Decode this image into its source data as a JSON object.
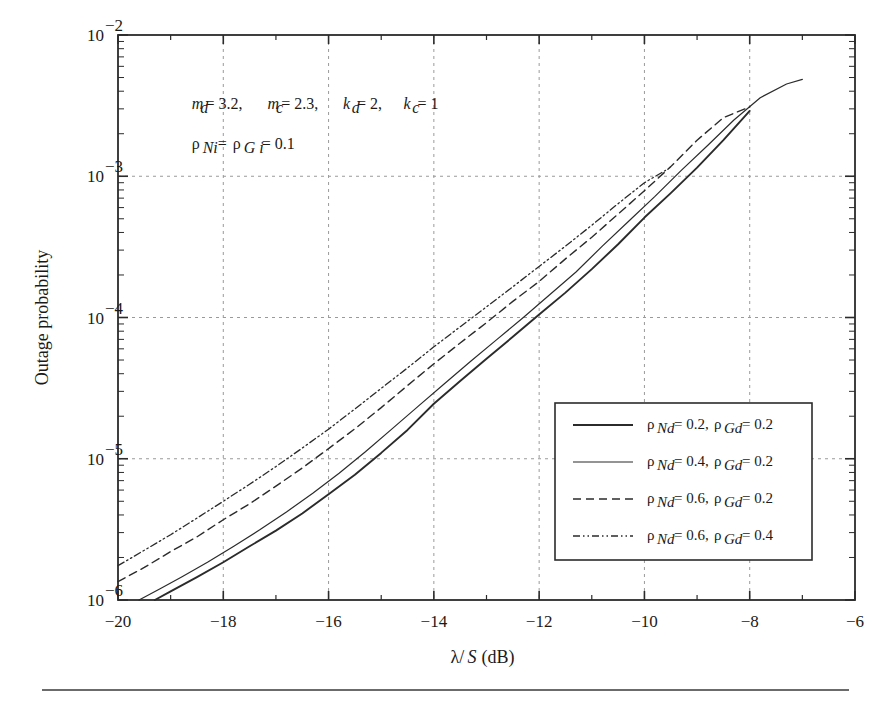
{
  "figure": {
    "background_color": "#ffffff",
    "line_color": "#2b2b2b",
    "grid_color": "#9a9a9a",
    "axis_color": "#2b2b2b",
    "caption_rule": true
  },
  "annotations": [
    {
      "id": "params-1",
      "text": "m_d = 3.2, m_c = 2.3, k_d = 2, k_c = 1",
      "x": -18.6,
      "y": 0.003
    },
    {
      "id": "params-2",
      "text": "ρ_Ni = ρ_Gi = 0.1",
      "x": -18.6,
      "y": 0.00155
    }
  ],
  "chart_data": {
    "type": "line",
    "title": "",
    "xlabel": "λ/S (dB)",
    "ylabel": "Outage probability",
    "xscale": "linear",
    "yscale": "log",
    "xlim": [
      -20,
      -6
    ],
    "ylim": [
      1e-06,
      0.01
    ],
    "xticks": [
      -20,
      -18,
      -16,
      -14,
      -12,
      -10,
      -8,
      -6
    ],
    "xtick_labels": [
      "−20",
      "−18",
      "−16",
      "−14",
      "−12",
      "−10",
      "−8",
      "−6"
    ],
    "yticks": [
      1e-06,
      1e-05,
      0.0001,
      0.001,
      0.01
    ],
    "ytick_labels": [
      "10⁻⁶",
      "10⁻⁵",
      "10⁻⁴",
      "10⁻³",
      "10⁻²"
    ],
    "grid": true,
    "grid_style": "dashed",
    "legend_position": "lower right",
    "series": [
      {
        "name": "ρ_Nd = 0.2, ρ_Gd = 0.2",
        "style": "solid",
        "width": 1.9,
        "x": [
          -19.3,
          -19.0,
          -18.5,
          -18.0,
          -17.5,
          -17.0,
          -16.5,
          -16.0,
          -15.5,
          -15.0,
          -14.5,
          -14.0,
          -13.5,
          -13.0,
          -12.5,
          -12.0,
          -11.5,
          -11.0,
          -10.5,
          -10.0,
          -9.5,
          -9.0,
          -8.5,
          -8.0
        ],
        "y": [
          1e-06,
          1.15e-06,
          1.45e-06,
          1.85e-06,
          2.4e-06,
          3.1e-06,
          4.1e-06,
          5.6e-06,
          7.7e-06,
          1.1e-05,
          1.6e-05,
          2.45e-05,
          3.55e-05,
          5.1e-05,
          7.3e-05,
          0.000105,
          0.00015,
          0.00022,
          0.00033,
          0.00051,
          0.00076,
          0.00115,
          0.0018,
          0.0029
        ]
      },
      {
        "name": "ρ_Nd = 0.4, ρ_Gd = 0.2",
        "style": "solid",
        "width": 1.2,
        "x": [
          -19.6,
          -19.2,
          -18.8,
          -18.3,
          -17.8,
          -17.3,
          -16.8,
          -16.3,
          -15.8,
          -15.3,
          -14.8,
          -14.3,
          -13.8,
          -13.3,
          -12.8,
          -12.3,
          -11.8,
          -11.3,
          -10.8,
          -10.3,
          -9.8,
          -9.3,
          -8.8,
          -8.3,
          -7.8,
          -7.3,
          -7.0
        ],
        "y": [
          1e-06,
          1.2e-06,
          1.45e-06,
          1.85e-06,
          2.4e-06,
          3.15e-06,
          4.2e-06,
          5.7e-06,
          7.9e-06,
          1.12e-05,
          1.62e-05,
          2.35e-05,
          3.4e-05,
          4.9e-05,
          7e-05,
          0.0001,
          0.000145,
          0.00021,
          0.00032,
          0.00048,
          0.00072,
          0.0011,
          0.00165,
          0.0025,
          0.0036,
          0.0045,
          0.00485
        ]
      },
      {
        "name": "ρ_Nd = 0.6, ρ_Gd = 0.2",
        "style": "dashed",
        "width": 1.4,
        "x": [
          -20.0,
          -19.5,
          -19.0,
          -18.5,
          -18.0,
          -17.5,
          -17.0,
          -16.5,
          -16.0,
          -15.5,
          -15.0,
          -14.5,
          -14.0,
          -13.5,
          -13.0,
          -12.5,
          -12.0,
          -11.5,
          -11.0,
          -10.5,
          -10.0,
          -9.5,
          -9.0,
          -8.5,
          -8.0
        ],
        "y": [
          1.35e-06,
          1.7e-06,
          2.2e-06,
          2.8e-06,
          3.7e-06,
          4.8e-06,
          6.4e-06,
          8.6e-06,
          1.18e-05,
          1.63e-05,
          2.3e-05,
          3.3e-05,
          4.7e-05,
          6.6e-05,
          9.2e-05,
          0.00013,
          0.00018,
          0.00026,
          0.00037,
          0.00054,
          0.00079,
          0.00117,
          0.0018,
          0.0026,
          0.0031
        ]
      },
      {
        "name": "ρ_Nd = 0.6, ρ_Gd = 0.4",
        "style": "dashdotdot",
        "width": 1.3,
        "x": [
          -20.0,
          -19.5,
          -19.0,
          -18.5,
          -18.0,
          -17.5,
          -17.0,
          -16.5,
          -16.0,
          -15.5,
          -15.0,
          -14.5,
          -14.0,
          -13.5,
          -13.0,
          -12.5,
          -12.0,
          -11.5,
          -11.0,
          -10.5,
          -10.0,
          -9.6
        ],
        "y": [
          1.75e-06,
          2.25e-06,
          2.9e-06,
          3.8e-06,
          5e-06,
          6.6e-06,
          8.8e-06,
          1.19e-05,
          1.62e-05,
          2.25e-05,
          3.15e-05,
          4.4e-05,
          6.2e-05,
          8.6e-05,
          0.000119,
          0.000165,
          0.00023,
          0.00032,
          0.00045,
          0.00064,
          0.0009,
          0.0011
        ]
      }
    ]
  },
  "legend": {
    "entries": [
      {
        "label": "ρ_Nd = 0.2, ρ_Gd = 0.2",
        "style": "solid",
        "sub1": "Nd",
        "sub2": "Gd",
        "v1": "0.2",
        "v2": "0.2"
      },
      {
        "label": "ρ_Nd = 0.4, ρ_Gd = 0.2",
        "style": "solid",
        "sub1": "Nd",
        "sub2": "Gd",
        "v1": "0.4",
        "v2": "0.2"
      },
      {
        "label": "ρ_Nd = 0.6, ρ_Gd = 0.2",
        "style": "dashed",
        "sub1": "Nd",
        "sub2": "Gd",
        "v1": "0.6",
        "v2": "0.2"
      },
      {
        "label": "ρ_Nd = 0.6, ρ_Gd = 0.4",
        "style": "dashdotdot",
        "sub1": "Nd",
        "sub2": "Gd",
        "v1": "0.6",
        "v2": "0.4"
      }
    ]
  }
}
